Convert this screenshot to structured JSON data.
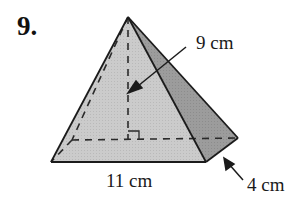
{
  "problem": {
    "number": "9."
  },
  "figure": {
    "shape": "rectangular pyramid",
    "labels": {
      "height": "9 cm",
      "base_length": "11 cm",
      "base_width": "4 cm"
    },
    "colors": {
      "front_face": "#c9c9c9",
      "side_face": "#9a9a9a",
      "edge": "#222222",
      "hidden_edge": "#333333"
    }
  }
}
